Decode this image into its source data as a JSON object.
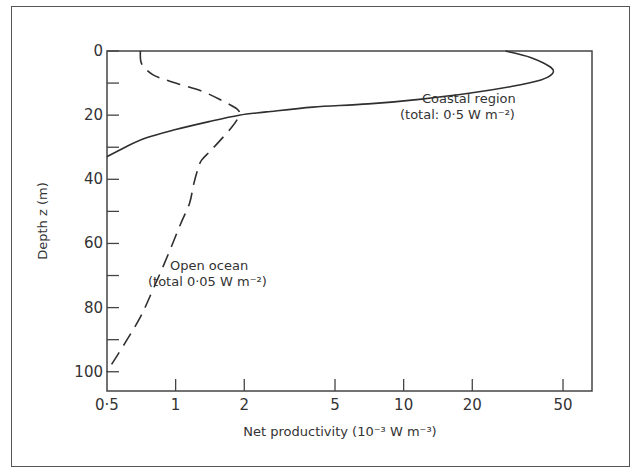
{
  "chart_data": {
    "type": "line",
    "title": "",
    "xlabel": "Net productivity (10⁻³ W m⁻³)",
    "ylabel": "Depth z (m)",
    "xscale": "log",
    "xlim": [
      0.5,
      67
    ],
    "ylim": [
      0,
      106
    ],
    "y_inverted": true,
    "grid": false,
    "x_ticks": [
      0.5,
      1,
      2,
      5,
      10,
      20,
      50
    ],
    "x_tick_labels": [
      "0·5",
      "1",
      "2",
      "5",
      "10",
      "20",
      "50"
    ],
    "y_ticks": [
      0,
      20,
      40,
      60,
      80,
      100
    ],
    "y_tick_labels": [
      "0",
      "20",
      "40",
      "60",
      "80",
      "100"
    ],
    "y_minor_ticks": [
      10,
      30,
      50,
      70,
      90
    ],
    "series": [
      {
        "name": "Coastal region",
        "style": "solid",
        "annotation": [
          "Coastal region",
          "(total: 0·5 W m⁻²)"
        ],
        "x": [
          28,
          36,
          44,
          45,
          40,
          30,
          20,
          12,
          7,
          4,
          2.5,
          1.9,
          1.4,
          1.0,
          0.75,
          0.6,
          0.5
        ],
        "y": [
          0,
          2,
          5,
          7,
          9,
          11,
          13,
          15,
          16.5,
          17.5,
          19,
          20,
          22,
          24.5,
          27,
          30,
          33
        ]
      },
      {
        "name": "Open ocean",
        "style": "dashed",
        "annotation": [
          "Open ocean",
          "(total 0·05 W m⁻²)"
        ],
        "x": [
          0.7,
          0.71,
          0.8,
          1.0,
          1.3,
          1.6,
          1.85,
          1.9,
          1.75,
          1.45,
          1.3,
          1.25,
          1.2,
          1.15,
          1.05,
          0.92,
          0.8,
          0.7,
          0.6,
          0.5
        ],
        "y": [
          0,
          4,
          7.5,
          10,
          12.5,
          15.5,
          18,
          20,
          24,
          30.5,
          34,
          37,
          41.5,
          47.5,
          54,
          64,
          74,
          83,
          91,
          100
        ]
      }
    ]
  }
}
